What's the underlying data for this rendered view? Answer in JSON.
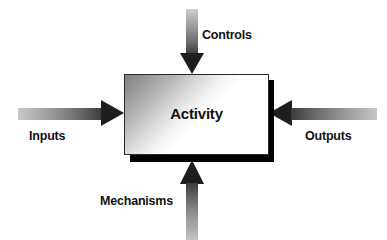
{
  "diagram": {
    "type": "IDEF0 activity box",
    "title": "",
    "box": {
      "label": "Activity",
      "fill_start_color": "#828282",
      "fill_end_color": "#ffffff",
      "border_color": "#2a2a2a",
      "shadow_color": "#000000"
    },
    "arrows": [
      {
        "id": "controls",
        "label": "Controls",
        "direction": "down",
        "target": "top edge of Activity box",
        "gradient_from": "#cfcfcf",
        "gradient_to": "#1e1e1e"
      },
      {
        "id": "inputs",
        "label": "Inputs",
        "direction": "right",
        "target": "left edge of Activity box",
        "gradient_from": "#c8c8c8",
        "gradient_to": "#1e1e1e"
      },
      {
        "id": "outputs",
        "label": "Outputs",
        "direction": "left",
        "target": "right edge of Activity box",
        "gradient_from": "#c6c6c6",
        "gradient_to": "#1e1e1e"
      },
      {
        "id": "mechanisms",
        "label": "Mechanisms",
        "direction": "up",
        "target": "bottom edge of Activity box",
        "gradient_from": "#c2c2c2",
        "gradient_to": "#1e1e1e"
      }
    ]
  }
}
